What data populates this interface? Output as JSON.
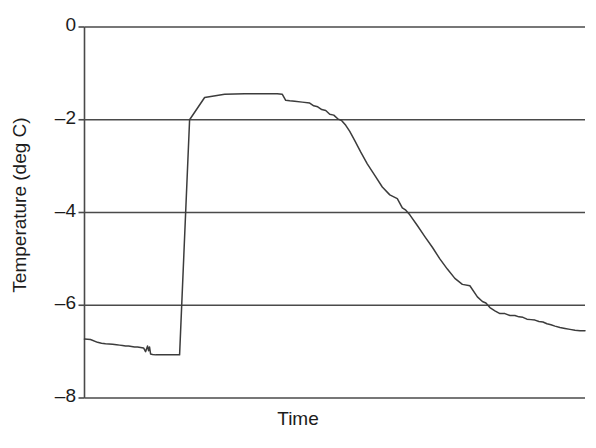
{
  "chart_data": {
    "type": "line",
    "title": "",
    "xlabel": "Time",
    "ylabel": "Temperature (deg C)",
    "xlim": [
      0,
      100
    ],
    "ylim": [
      -8,
      0
    ],
    "yticks": [
      0,
      -2,
      -4,
      -6,
      -8
    ],
    "ytick_labels": [
      "0",
      "–2",
      "–4",
      "–6",
      "–8"
    ],
    "xticks": [],
    "xtick_labels": [],
    "grid": "horizontal",
    "legend": "none",
    "line_color": "#3c3c3c",
    "axis_color": "#4a4a4a",
    "background": "#ffffff",
    "series": [
      {
        "name": "Temperature",
        "x": [
          0.0,
          1.2,
          2.6,
          3.4,
          4.2,
          5.6,
          6.4,
          7.0,
          7.6,
          8.2,
          8.8,
          9.4,
          10.0,
          10.6,
          11.2,
          11.8,
          12.2,
          12.6,
          12.8,
          13.0,
          13.2,
          13.6,
          14.2,
          15.0,
          16.0,
          17.5,
          19.0,
          21.0,
          24.0,
          28.0,
          32.0,
          36.0,
          38.5,
          39.5,
          40.2,
          41.0,
          42.0,
          43.5,
          45.0,
          45.8,
          46.6,
          47.4,
          48.2,
          49.0,
          49.8,
          50.6,
          51.4,
          52.2,
          53.0,
          54.0,
          55.2,
          56.5,
          58.0,
          59.5,
          61.0,
          62.5,
          63.5,
          64.2,
          65.0,
          66.5,
          68.0,
          69.5,
          71.0,
          72.5,
          74.0,
          75.5,
          77.0,
          78.5,
          79.5,
          80.2,
          81.0,
          82.0,
          83.0,
          84.0,
          85.0,
          86.0,
          86.8,
          87.6,
          88.4,
          89.2,
          90.0,
          90.8,
          91.6,
          92.4,
          93.2,
          94.0,
          95.0,
          96.0,
          97.0,
          98.0,
          99.0,
          100.0
        ],
        "y": [
          -6.73,
          -6.74,
          -6.8,
          -6.82,
          -6.83,
          -6.84,
          -6.85,
          -6.86,
          -6.87,
          -6.88,
          -6.88,
          -6.89,
          -6.9,
          -6.9,
          -6.91,
          -6.92,
          -7.0,
          -6.88,
          -6.98,
          -6.9,
          -7.05,
          -7.06,
          -7.07,
          -7.07,
          -7.07,
          -7.07,
          -7.07,
          -2.0,
          -1.52,
          -1.45,
          -1.44,
          -1.44,
          -1.44,
          -1.45,
          -1.58,
          -1.59,
          -1.6,
          -1.62,
          -1.64,
          -1.7,
          -1.72,
          -1.78,
          -1.8,
          -1.88,
          -1.9,
          -1.98,
          -2.02,
          -2.12,
          -2.25,
          -2.45,
          -2.7,
          -2.95,
          -3.2,
          -3.45,
          -3.62,
          -3.7,
          -3.9,
          -3.95,
          -4.05,
          -4.28,
          -4.52,
          -4.75,
          -5.0,
          -5.22,
          -5.42,
          -5.55,
          -5.58,
          -5.82,
          -5.92,
          -5.95,
          -6.05,
          -6.12,
          -6.18,
          -6.18,
          -6.22,
          -6.22,
          -6.25,
          -6.26,
          -6.3,
          -6.31,
          -6.32,
          -6.35,
          -6.36,
          -6.4,
          -6.42,
          -6.45,
          -6.48,
          -6.5,
          -6.52,
          -6.54,
          -6.55,
          -6.55
        ]
      }
    ]
  },
  "axes": {
    "ylabel_text": "Temperature (deg C)",
    "xlabel_text": "Time"
  }
}
